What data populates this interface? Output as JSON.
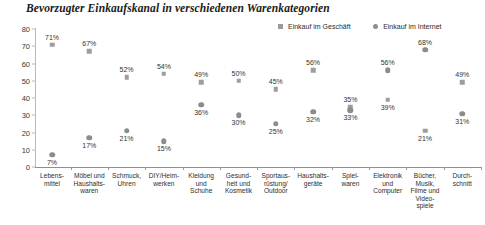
{
  "title": "Bevorzugter Einkaufskanal in verschiedenen Warenkategorien",
  "legend": {
    "store": "Einkauf im Geschäft",
    "internet": "Einkauf im Internet"
  },
  "colors": {
    "store_marker": "#9d9d9d",
    "internet_marker": "#8c8c8c",
    "axis": "#8f8f8f",
    "text": "#2e2e2e"
  },
  "axis": {
    "y_ticks": [
      "0",
      "10",
      "20",
      "30",
      "40",
      "50",
      "60",
      "70",
      "80"
    ]
  },
  "chart_data": {
    "type": "scatter",
    "title": "Bevorzugter Einkaufskanal in verschiedenen Warenkategorien",
    "xlabel": "",
    "ylabel": "",
    "ylim": [
      0,
      80
    ],
    "yticks": [
      0,
      10,
      20,
      30,
      40,
      50,
      60,
      70,
      80
    ],
    "grid": false,
    "legend_position": "top-right",
    "categories": [
      "Lebens-\nmittel",
      "Möbel und\nHaushalts-\nwaren",
      "Schmuck,\nUhren",
      "DIY/Heim-\nwerken",
      "Kleidung\nund\nSchuhe",
      "Gesund-\nheit und\nKosmetik",
      "Sportaus-\nrüstung/\nOutdoor",
      "Haushalts-\ngeräte",
      "Spiel-\nwaren",
      "Elektronik\nund\nComputer",
      "Bücher,\nMusik,\nFilme und\nVideo-\nspiele",
      "Durch-\nschnitt"
    ],
    "series": [
      {
        "name": "Einkauf im Geschäft",
        "marker": "square",
        "values": [
          71,
          67,
          52,
          54,
          49,
          50,
          45,
          56,
          35,
          39,
          21,
          49
        ],
        "labels": [
          "71%",
          "67%",
          "52%",
          "54%",
          "49%",
          "50%",
          "45%",
          "56%",
          "35%",
          "39%",
          "21%",
          "49%"
        ]
      },
      {
        "name": "Einkauf im Internet",
        "marker": "circle",
        "values": [
          7,
          17,
          21,
          15,
          36,
          30,
          25,
          32,
          33,
          56,
          68,
          31
        ],
        "labels": [
          "7%",
          "17%",
          "21%",
          "15%",
          "36%",
          "30%",
          "25%",
          "32%",
          "33%",
          "56%",
          "68%",
          "31%"
        ]
      }
    ]
  }
}
